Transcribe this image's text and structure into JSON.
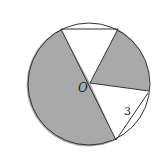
{
  "diagram": {
    "type": "circle-sectors",
    "center_label": "O",
    "side_label": "3",
    "colors": {
      "shade": "#a9a9a9",
      "stroke": "#333333",
      "background": "#ffffff"
    },
    "circle": {
      "cx": 89,
      "cy": 84,
      "r": 61
    },
    "points": {
      "O": [
        90,
        83
      ],
      "A": [
        61,
        29
      ],
      "B": [
        118,
        29
      ],
      "C": [
        149,
        91
      ],
      "D": [
        116,
        140
      ]
    }
  }
}
